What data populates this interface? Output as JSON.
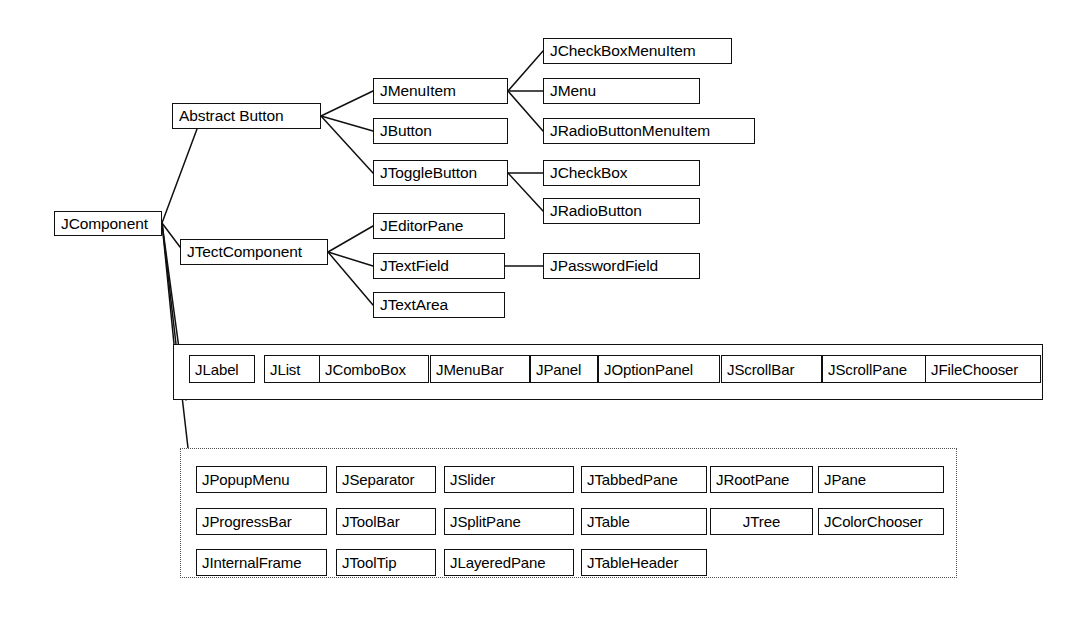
{
  "diagram": {
    "style": {
      "line_color": "#101010",
      "box_border_color": "#101010",
      "dotted_border_color": "#555555",
      "background": "#ffffff",
      "text_color": "#000000"
    },
    "root": {
      "label": "JComponent",
      "x": 54,
      "y": 211,
      "w": 108,
      "h": 25
    },
    "branches": [
      {
        "name": "abstract-button-branch",
        "parent": {
          "label": "Abstract Button",
          "x": 172,
          "y": 103,
          "w": 149,
          "h": 26
        },
        "children": [
          {
            "label": "JMenuItem",
            "x": 373,
            "y": 78,
            "w": 135,
            "h": 26,
            "children": [
              {
                "label": "JCheckBoxMenuItem",
                "x": 543,
                "y": 38,
                "w": 189,
                "h": 26
              },
              {
                "label": "JMenu",
                "x": 543,
                "y": 78,
                "w": 157,
                "h": 26
              },
              {
                "label": "JRadioButtonMenuItem",
                "x": 543,
                "y": 118,
                "w": 212,
                "h": 26
              }
            ]
          },
          {
            "label": "JButton",
            "x": 373,
            "y": 118,
            "w": 135,
            "h": 26,
            "children": []
          },
          {
            "label": "JToggleButton",
            "x": 373,
            "y": 160,
            "w": 135,
            "h": 26,
            "children": [
              {
                "label": "JCheckBox",
                "x": 543,
                "y": 160,
                "w": 157,
                "h": 26
              },
              {
                "label": "JRadioButton",
                "x": 543,
                "y": 198,
                "w": 157,
                "h": 26
              }
            ]
          }
        ]
      },
      {
        "name": "text-component-branch",
        "parent": {
          "label": "JTectComponent",
          "x": 180,
          "y": 239,
          "w": 148,
          "h": 26
        },
        "children": [
          {
            "label": "JEditorPane",
            "x": 373,
            "y": 213,
            "w": 132,
            "h": 26,
            "children": []
          },
          {
            "label": "JTextField",
            "x": 373,
            "y": 253,
            "w": 132,
            "h": 26,
            "children": [
              {
                "label": "JPasswordField",
                "x": 543,
                "y": 253,
                "w": 157,
                "h": 26
              }
            ]
          },
          {
            "label": "JTextArea",
            "x": 373,
            "y": 292,
            "w": 132,
            "h": 26,
            "children": []
          }
        ]
      }
    ],
    "solid_group": {
      "name": "direct-subclasses-row",
      "x": 173,
      "y": 344,
      "w": 870,
      "h": 56,
      "items": [
        {
          "label": "JLabel",
          "x": 189,
          "y": 355,
          "w": 66,
          "h": 28
        },
        {
          "label": "JList",
          "x": 264,
          "y": 355,
          "w": 56,
          "h": 28
        },
        {
          "label": "JComboBox",
          "x": 319,
          "y": 355,
          "w": 110,
          "h": 28
        },
        {
          "label": "JMenuBar",
          "x": 430,
          "y": 355,
          "w": 100,
          "h": 28
        },
        {
          "label": "JPanel",
          "x": 530,
          "y": 355,
          "w": 68,
          "h": 28
        },
        {
          "label": "JOptionPanel",
          "x": 598,
          "y": 355,
          "w": 122,
          "h": 28
        },
        {
          "label": "JScrollBar",
          "x": 721,
          "y": 355,
          "w": 101,
          "h": 28
        },
        {
          "label": "JScrollPane",
          "x": 822,
          "y": 355,
          "w": 110,
          "h": 28
        },
        {
          "label": "JFileChooser",
          "x": 925,
          "y": 355,
          "w": 116,
          "h": 28
        }
      ]
    },
    "dotted_group": {
      "name": "additional-components-group",
      "x": 180,
      "y": 448,
      "w": 777,
      "h": 130,
      "items": [
        {
          "label": "JPopupMenu",
          "x": 196,
          "y": 466,
          "w": 131,
          "h": 27,
          "center": false
        },
        {
          "label": "JSeparator",
          "x": 336,
          "y": 466,
          "w": 100,
          "h": 27,
          "center": false
        },
        {
          "label": "JSlider",
          "x": 444,
          "y": 466,
          "w": 130,
          "h": 27,
          "center": false
        },
        {
          "label": "JTabbedPane",
          "x": 581,
          "y": 466,
          "w": 126,
          "h": 27,
          "center": false
        },
        {
          "label": "JRootPane",
          "x": 710,
          "y": 466,
          "w": 103,
          "h": 27,
          "center": false
        },
        {
          "label": "JPane",
          "x": 818,
          "y": 466,
          "w": 126,
          "h": 27,
          "center": false
        },
        {
          "label": "JProgressBar",
          "x": 196,
          "y": 508,
          "w": 131,
          "h": 27,
          "center": false
        },
        {
          "label": "JToolBar",
          "x": 336,
          "y": 508,
          "w": 100,
          "h": 27,
          "center": false
        },
        {
          "label": "JSplitPane",
          "x": 444,
          "y": 508,
          "w": 130,
          "h": 27,
          "center": false
        },
        {
          "label": "JTable",
          "x": 581,
          "y": 508,
          "w": 126,
          "h": 27,
          "center": false
        },
        {
          "label": "JTree",
          "x": 710,
          "y": 508,
          "w": 103,
          "h": 27,
          "center": true
        },
        {
          "label": "JColorChooser",
          "x": 818,
          "y": 508,
          "w": 126,
          "h": 27,
          "center": false
        },
        {
          "label": "JInternalFrame",
          "x": 196,
          "y": 549,
          "w": 131,
          "h": 27,
          "center": false
        },
        {
          "label": "JToolTip",
          "x": 336,
          "y": 549,
          "w": 100,
          "h": 27,
          "center": false
        },
        {
          "label": "JLayeredPane",
          "x": 444,
          "y": 549,
          "w": 130,
          "h": 27,
          "center": false
        },
        {
          "label": "JTableHeader",
          "x": 581,
          "y": 549,
          "w": 126,
          "h": 27,
          "center": false
        }
      ]
    },
    "connectors": [
      {
        "from": "JComponent",
        "to": "Abstract Button",
        "path": "M 162 223 L 197 129"
      },
      {
        "from": "JComponent",
        "to": "JTectComponent",
        "path": "M 162 223 L 180 247"
      },
      {
        "from": "JComponent",
        "to": "direct-subclasses-row",
        "path": "M 162 223 L 174 344"
      },
      {
        "from": "JComponent",
        "to": "direct-subclasses-row-bottom",
        "path": "M 162 223 L 186 400"
      },
      {
        "from": "JComponent",
        "to": "additional-components-group",
        "path": "M 162 223 L 188 448"
      },
      {
        "from": "Abstract Button",
        "to": "JMenuItem",
        "path": "M 321 116 L 373 91"
      },
      {
        "from": "Abstract Button",
        "to": "JButton",
        "path": "M 321 116 L 373 131"
      },
      {
        "from": "Abstract Button",
        "to": "JToggleButton",
        "path": "M 321 116 L 373 173"
      },
      {
        "from": "JMenuItem",
        "to": "JCheckBoxMenuItem",
        "path": "M 508 91 L 543 51"
      },
      {
        "from": "JMenuItem",
        "to": "JMenu",
        "path": "M 508 91 L 543 91"
      },
      {
        "from": "JMenuItem",
        "to": "JRadioButtonMenuItem",
        "path": "M 508 91 L 543 131"
      },
      {
        "from": "JToggleButton",
        "to": "JCheckBox",
        "path": "M 508 173 L 543 173"
      },
      {
        "from": "JToggleButton",
        "to": "JRadioButton",
        "path": "M 508 173 L 543 211"
      },
      {
        "from": "JTectComponent",
        "to": "JEditorPane",
        "path": "M 328 252 L 373 226"
      },
      {
        "from": "JTectComponent",
        "to": "JTextField",
        "path": "M 328 252 L 373 266"
      },
      {
        "from": "JTectComponent",
        "to": "JTextArea",
        "path": "M 328 252 L 373 305"
      },
      {
        "from": "JTextField",
        "to": "JPasswordField",
        "path": "M 505 266 L 543 266"
      }
    ]
  }
}
